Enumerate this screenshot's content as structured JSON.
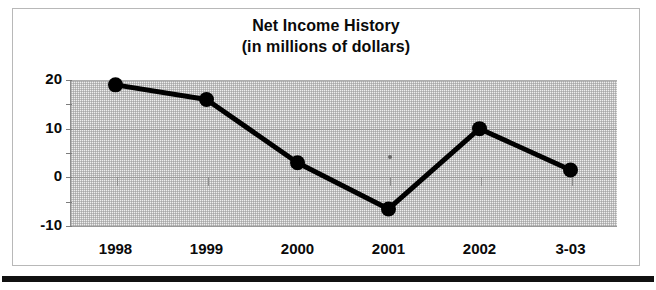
{
  "page": {
    "background_color": "#ffffff",
    "frame_border_color": "#b8b8b8",
    "bottom_rule_color": "#111111"
  },
  "chart_data": {
    "type": "line",
    "title": "Net Income History",
    "subtitle": "(in millions of dollars)",
    "xlabel": "",
    "ylabel": "",
    "categories": [
      "1998",
      "1999",
      "2000",
      "2001",
      "2002",
      "3-03"
    ],
    "values": [
      19,
      16,
      3,
      -6.5,
      10,
      1.5
    ],
    "series": [
      {
        "name": "Net Income",
        "values": [
          19,
          16,
          3,
          -6.5,
          10,
          1.5
        ]
      }
    ],
    "ylim": [
      -10,
      20
    ],
    "yticks": [
      20,
      10,
      0,
      -10
    ],
    "ytick_labels": [
      "20",
      "10",
      "0",
      "-10"
    ],
    "yminorticks": [
      15,
      5,
      -5
    ],
    "grid": true,
    "legend": "none",
    "line_color": "#000000",
    "marker": "circle",
    "marker_color": "#000000",
    "plot_background_color": "#eeeeee",
    "units": "millions of dollars"
  }
}
